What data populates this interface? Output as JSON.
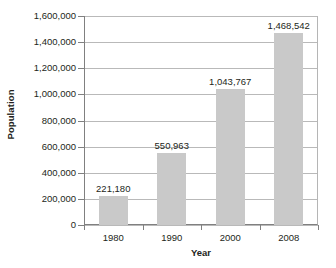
{
  "chart_data": {
    "type": "bar",
    "title": "",
    "subtitle": "",
    "xlabel": "Year",
    "ylabel": "Population",
    "categories": [
      "1980",
      "1990",
      "2000",
      "2008"
    ],
    "values": [
      221180,
      550963,
      1043767,
      1468542
    ],
    "value_labels": [
      "221,180",
      "550,963",
      "1,043,767",
      "1,468,542"
    ],
    "ylim": [
      0,
      1600000
    ],
    "ytick_values": [
      0,
      200000,
      400000,
      600000,
      800000,
      1000000,
      1200000,
      1400000,
      1600000
    ],
    "ytick_labels": [
      "0",
      "200,000",
      "400,000",
      "600,000",
      "800,000",
      "1,000,000",
      "1,200,000",
      "1,400,000",
      "1,600,000"
    ],
    "grid": true,
    "grid_axis": "y",
    "legend": false,
    "legend_position": "none",
    "bar_color": "#c9c9c9",
    "gridline_color": "#b9b9b9",
    "axis_color": "#808080",
    "text_color": "#231f20",
    "background_color": "#ffffff"
  }
}
